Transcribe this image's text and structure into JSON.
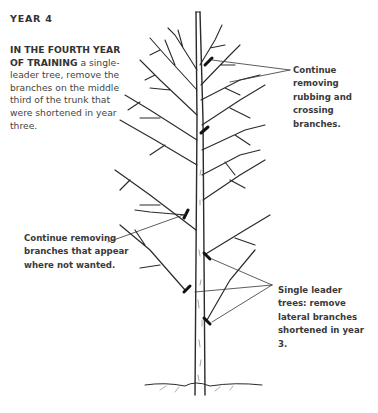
{
  "heading": {
    "year": "YEAR 4"
  },
  "intro": {
    "bold_lead": "IN THE FOURTH YEAR OF TRAINING",
    "text": " a single-leader tree, remove the branches on the middle third of the trunk that were shortened in year three."
  },
  "callouts": [
    {
      "id": "rubbing",
      "text": "Continue removing rubbing and crossing branches."
    },
    {
      "id": "unwanted",
      "text": "Continue removing branches that appear where not wanted."
    },
    {
      "id": "lateral",
      "text": "Single leader trees: remove lateral branches shortened in year 3."
    }
  ],
  "illustration": {
    "subject": "single-leader tree with pruning cut marks",
    "line_color": "#2a2a2a"
  }
}
